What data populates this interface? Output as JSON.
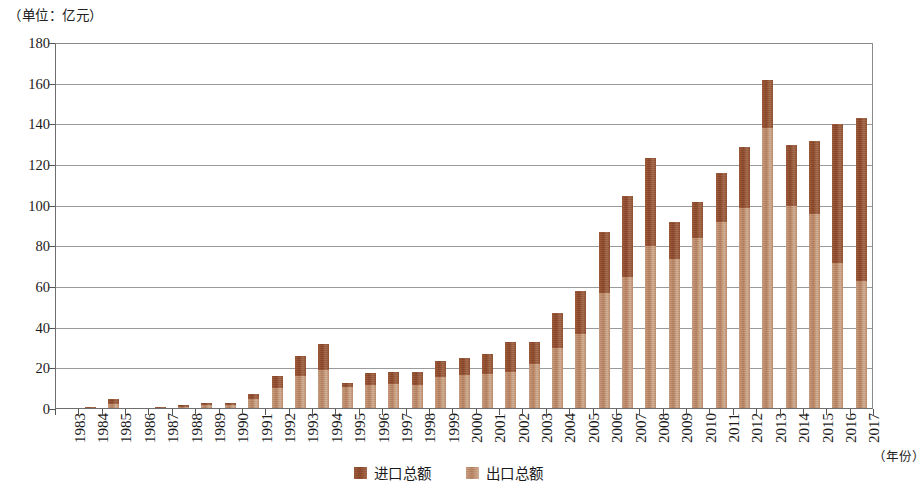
{
  "chart_data": {
    "type": "bar",
    "subtype": "stacked-vertical",
    "title": "",
    "unit_caption": "（单位：亿元）",
    "xlabel": "（年份）",
    "ylabel": "",
    "ylim": [
      0,
      180
    ],
    "y_ticks": [
      0,
      20,
      40,
      60,
      80,
      100,
      120,
      140,
      160,
      180
    ],
    "grid": true,
    "legend_position": "bottom-center",
    "categories": [
      "1983",
      "1984",
      "1985",
      "1986",
      "1987",
      "1988",
      "1989",
      "1990",
      "1991",
      "1992",
      "1993",
      "1994",
      "1995",
      "1996",
      "1997",
      "1998",
      "1999",
      "2000",
      "2001",
      "2002",
      "2003",
      "2004",
      "2005",
      "2006",
      "2007",
      "2008",
      "2009",
      "2010",
      "2011",
      "2012",
      "2013",
      "2014",
      "2015",
      "2016",
      "2017"
    ],
    "series": [
      {
        "name": "出口总额",
        "color": "#bb8a68",
        "stack_order": 1,
        "values": [
          0.3,
          0.6,
          2.6,
          0.3,
          0.6,
          1.2,
          1.8,
          1.8,
          5.0,
          10.5,
          16.0,
          19.0,
          11.0,
          12.0,
          12.5,
          12.0,
          15.5,
          16.5,
          17.0,
          18.0,
          22.0,
          30.0,
          37.0,
          57.0,
          65.0,
          80.0,
          74.0,
          84.0,
          92.0,
          99.0,
          138.0,
          100.0,
          96.0,
          72.0,
          63.0
        ]
      },
      {
        "name": "进口总额",
        "color": "#8f4d2d",
        "stack_order": 2,
        "values": [
          0.2,
          0.4,
          2.4,
          0.2,
          0.4,
          0.8,
          1.2,
          1.2,
          2.5,
          5.5,
          10.0,
          13.0,
          2.0,
          5.5,
          5.5,
          6.0,
          8.0,
          8.5,
          10.0,
          15.0,
          11.0,
          17.0,
          21.0,
          30.0,
          40.0,
          43.5,
          18.0,
          18.0,
          24.0,
          30.0,
          24.0,
          30.0,
          36.0,
          68.0,
          80.0
        ]
      }
    ],
    "totals": [
      0.5,
      1.0,
      5.0,
      0.5,
      1.0,
      2.0,
      3.0,
      3.0,
      7.5,
      16.0,
      26.0,
      32.0,
      13.0,
      17.5,
      18.0,
      18.0,
      23.5,
      25.0,
      27.0,
      33.0,
      33.0,
      47.0,
      58.0,
      87.0,
      105.0,
      123.5,
      92.0,
      102.0,
      116.0,
      129.0,
      162.0,
      130.0,
      132.0,
      140.0,
      143.0
    ]
  },
  "legend": {
    "items": [
      {
        "label": "进口总额",
        "kind": "import"
      },
      {
        "label": "出口总额",
        "kind": "export"
      }
    ]
  },
  "colors": {
    "import": "#8f4d2d",
    "export": "#bb8a68",
    "axis": "#555555",
    "grid": "#9a9a9a",
    "text": "#1a1a1a",
    "background": "#ffffff"
  }
}
